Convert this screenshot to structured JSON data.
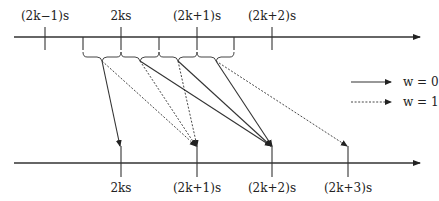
{
  "diagram": {
    "top_axis": {
      "labels": [
        "(2k−1)s",
        "2ks",
        "(2k+1)s",
        "(2k+2)s"
      ]
    },
    "bottom_axis": {
      "labels": [
        "2ks",
        "(2k+1)s",
        "(2k+2)s",
        "(2k+3)s"
      ]
    },
    "legend": [
      {
        "style": "solid",
        "label": "w = 0"
      },
      {
        "style": "dotted",
        "label": "w = 1"
      }
    ],
    "mappings": [
      {
        "from_interval": 0,
        "to": "2ks",
        "style": "solid"
      },
      {
        "from_interval": 0,
        "to": "(2k+1)s",
        "style": "dotted"
      },
      {
        "from_interval": 1,
        "to": "(2k+1)s",
        "style": "dotted"
      },
      {
        "from_interval": 1,
        "to": "(2k+2)s",
        "style": "solid"
      },
      {
        "from_interval": 2,
        "to": "(2k+1)s",
        "style": "dotted"
      },
      {
        "from_interval": 2,
        "to": "(2k+2)s",
        "style": "solid"
      },
      {
        "from_interval": 3,
        "to": "(2k+2)s",
        "style": "solid"
      },
      {
        "from_interval": 3,
        "to": "(2k+3)s",
        "style": "dotted"
      }
    ],
    "colors": {
      "ink": "#333333",
      "background": "#ffffff"
    }
  }
}
